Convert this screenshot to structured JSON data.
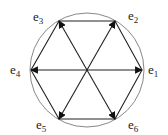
{
  "diagram": {
    "circle": {
      "cx": 87,
      "cy": 70,
      "r": 57
    },
    "center": {
      "x": 87,
      "y": 70
    },
    "vectors": [
      {
        "id": "e1",
        "label": "e",
        "sub": "1",
        "x": 142,
        "y": 70,
        "lx": 148,
        "ly": 74
      },
      {
        "id": "e2",
        "label": "e",
        "sub": "2",
        "x": 115,
        "y": 21,
        "lx": 128,
        "ly": 20
      },
      {
        "id": "e3",
        "label": "e",
        "sub": "3",
        "x": 59,
        "y": 21,
        "lx": 33,
        "ly": 21
      },
      {
        "id": "e4",
        "label": "e",
        "sub": "4",
        "x": 31,
        "y": 70,
        "lx": 10,
        "ly": 74
      },
      {
        "id": "e5",
        "label": "e",
        "sub": "5",
        "x": 59,
        "y": 119,
        "lx": 36,
        "ly": 129
      },
      {
        "id": "e6",
        "label": "e",
        "sub": "6",
        "x": 115,
        "y": 119,
        "lx": 128,
        "ly": 129
      }
    ],
    "colors": {
      "line": "#222222",
      "circle": "#888888"
    }
  }
}
